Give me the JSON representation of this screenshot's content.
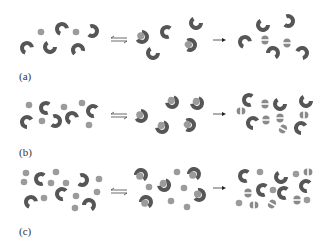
{
  "figure": {
    "colors": {
      "enzyme": "#555555",
      "enzyme_dark": "#3c3c3c",
      "substrate": "#9a9a9a",
      "arrow": "#333333",
      "background": "#ffffff"
    },
    "panels": [
      {
        "label": "(a)",
        "label_pos": [
          20,
          80
        ],
        "y_offset": 0,
        "free_enzymes": [
          [
            22,
            48,
            40
          ],
          [
            64,
            42,
            0
          ],
          [
            110,
            50,
            -60
          ],
          [
            54,
            18,
            150
          ],
          [
            95,
            21,
            -100
          ],
          [
            19,
            13,
            0
          ]
        ],
        "free_substrates": [
          [
            41,
            32
          ],
          [
            76,
            32
          ]
        ],
        "complexes": [
          [
            140,
            36,
            -30
          ],
          [
            174,
            19,
            210
          ],
          [
            154,
            53,
            -90
          ],
          [
            200,
            26,
            -40
          ],
          [
            186,
            47,
            -20
          ]
        ],
        "free_substrates_mid": [],
        "product_enzymes": [
          [
            245,
            41,
            40
          ],
          [
            263,
            24,
            210
          ],
          [
            273,
            48,
            -90
          ],
          [
            291,
            22,
            150
          ],
          [
            306,
            52,
            -40
          ]
        ],
        "fragments": [
          [
            266,
            37
          ],
          [
            287,
            40
          ]
        ],
        "free_substrates_right": []
      }
    ],
    "equilibrium_arrows": [
      [
        108,
        36
      ],
      [
        108,
        115
      ],
      [
        108,
        193
      ]
    ],
    "forward_arrows": [
      [
        212,
        40
      ],
      [
        212,
        115
      ],
      [
        212,
        191
      ]
    ],
    "panel_labels": [
      "(a)",
      "(b)",
      "(c)"
    ]
  }
}
